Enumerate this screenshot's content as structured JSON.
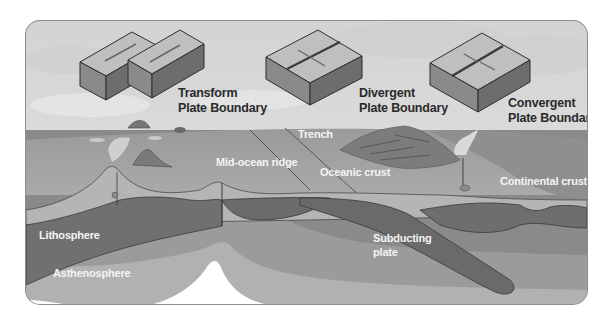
{
  "diagram": {
    "title_visible": false,
    "palette": {
      "frame": "#8c8c8c",
      "sky": "#dcdcdc",
      "ocean_surface": "#a6a6a6",
      "crust_light": "#b9b9b9",
      "lithosphere": "#6f6f6f",
      "lithosphere_outline": "#3a3a3a",
      "asthenosphere_upper": "#8e8e8e",
      "asthenosphere_mid": "#9e9e9e",
      "asthenosphere_lower": "#b3b3b3",
      "deep_mantle": "#ffffff",
      "label_dark": "#2a2a2a",
      "label_light": "#f4f4f4"
    },
    "boundary_types": [
      {
        "id": "transform",
        "line1": "Transform",
        "line2": "Plate Boundary",
        "icon": "transform-blocks-icon"
      },
      {
        "id": "divergent",
        "line1": "Divergent",
        "line2": "Plate Boundary",
        "icon": "divergent-block-icon"
      },
      {
        "id": "convergent",
        "line1": "Convergent",
        "line2": "Plate Boundary",
        "icon": "convergent-block-icon"
      }
    ],
    "cross_section_labels": {
      "trench": "Trench",
      "mid_ocean_ridge": "Mid-ocean ridge",
      "oceanic_crust": "Oceanic crust",
      "continental_crust": "Continental crust",
      "lithosphere": "Lithosphere",
      "asthenosphere": "Asthenosphere",
      "subducting_line1": "Subducting",
      "subducting_line2": "plate"
    }
  }
}
